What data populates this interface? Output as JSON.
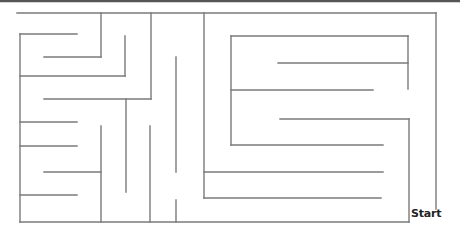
{
  "maze": {
    "start_label": "Start",
    "colors": {
      "wall": "#7a7a7a",
      "top_border": "#555555",
      "background": "#ffffff"
    },
    "top_border": {
      "x1": 0,
      "y1": 1,
      "x2": 460,
      "y2": 1
    },
    "walls": [
      [
        17,
        13,
        436,
        13
      ],
      [
        101,
        13,
        101,
        57
      ],
      [
        44,
        57,
        101,
        57
      ],
      [
        20,
        34,
        77,
        34
      ],
      [
        20,
        34,
        20,
        222
      ],
      [
        125,
        36,
        125,
        76
      ],
      [
        20,
        76,
        125,
        76
      ],
      [
        151,
        13,
        151,
        99
      ],
      [
        44,
        99,
        151,
        99
      ],
      [
        126,
        99,
        126,
        192
      ],
      [
        20,
        122,
        77,
        122
      ],
      [
        20,
        146,
        77,
        146
      ],
      [
        101,
        126,
        101,
        222
      ],
      [
        44,
        172,
        101,
        172
      ],
      [
        20,
        195,
        77,
        195
      ],
      [
        20,
        222,
        409,
        222
      ],
      [
        150,
        126,
        150,
        222
      ],
      [
        176,
        57,
        176,
        172
      ],
      [
        176,
        200,
        176,
        222
      ],
      [
        204,
        13,
        204,
        198
      ],
      [
        204,
        172,
        383,
        172
      ],
      [
        204,
        198,
        381,
        198
      ],
      [
        231,
        36,
        408,
        36
      ],
      [
        408,
        36,
        408,
        89
      ],
      [
        278,
        63,
        408,
        63
      ],
      [
        231,
        36,
        231,
        145
      ],
      [
        231,
        90,
        373,
        90
      ],
      [
        231,
        145,
        383,
        145
      ],
      [
        280,
        119,
        409,
        119
      ],
      [
        409,
        119,
        409,
        222
      ],
      [
        436,
        13,
        436,
        209
      ]
    ]
  }
}
